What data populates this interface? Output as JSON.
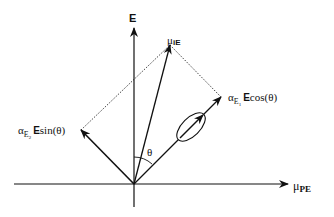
{
  "diagram": {
    "type": "vector-decomposition",
    "axes": {
      "vertical_label": "E",
      "horizontal_label_symbol": "μ",
      "horizontal_label_sub": "PE"
    },
    "vectors": {
      "induced_dipole": {
        "symbol": "μ",
        "sub": "iE"
      },
      "component_1": {
        "alpha": "α",
        "sub": "E",
        "subsub": "1",
        "field": "E",
        "func": "cos(θ)"
      },
      "component_2": {
        "alpha": "α",
        "sub": "E",
        "subsub": "2",
        "field": "E",
        "func": "sin(θ)"
      }
    },
    "angle_label": "θ",
    "colors": {
      "stroke": "#111111",
      "background": "#ffffff"
    }
  }
}
